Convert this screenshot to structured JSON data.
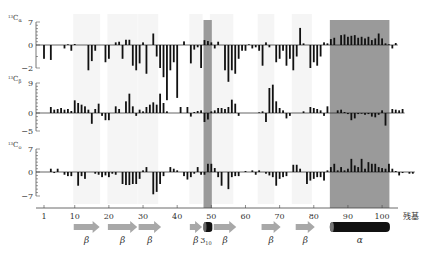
{
  "chart_data": {
    "type": "bar",
    "title": "",
    "xlabel": "残基",
    "x_ticks": [
      1,
      10,
      20,
      30,
      40,
      50,
      60,
      70,
      80,
      90,
      100
    ],
    "x_range": [
      1,
      104
    ],
    "highlight_regions": [
      {
        "start": 48,
        "end": 50,
        "color": "#9a9a9a"
      },
      {
        "start": 85,
        "end": 102,
        "color": "#9a9a9a"
      }
    ],
    "light_bands": [
      {
        "start": 10,
        "end": 17
      },
      {
        "start": 20,
        "end": 28
      },
      {
        "start": 29,
        "end": 34
      },
      {
        "start": 44,
        "end": 47
      },
      {
        "start": 50,
        "end": 56
      },
      {
        "start": 64,
        "end": 68
      },
      {
        "start": 74,
        "end": 79
      }
    ],
    "panels": [
      {
        "name": "13C-alpha",
        "ylabel_sup": "13",
        "ylabel_main": "C",
        "ylabel_sub": "α",
        "yticks": [
          7,
          0,
          -2
        ],
        "ylim": [
          -2,
          7
        ],
        "values": [
          -1.2,
          0,
          -1.3,
          0,
          0,
          0,
          -0.3,
          0.2,
          -0.5,
          0.3,
          0,
          0,
          0,
          -2.2,
          -1.4,
          -0.5,
          0,
          0,
          -1.5,
          -1.2,
          0,
          0.8,
          1.0,
          -1.2,
          1.6,
          1.6,
          -1.8,
          -2.2,
          -1.6,
          0.8,
          -2.5,
          0,
          3.5,
          -1.0,
          -2.0,
          -2.8,
          -4.8,
          -2.2,
          -1.5,
          -4.6,
          0,
          1.1,
          0,
          -1.6,
          -0.4,
          -0.2,
          -2.0,
          1.5,
          1.2,
          0.8,
          -0.3,
          1.0,
          0,
          -2.2,
          -3.2,
          -2.2,
          -2.5,
          -1.2,
          -0.5,
          -0.5,
          0.2,
          -0.3,
          -0.2,
          -0.5,
          -1.8,
          0.8,
          -0.2,
          0,
          -1.5,
          -1.2,
          -0.5,
          -1.8,
          -1.2,
          -2.2,
          -1.0,
          5.2,
          0.5,
          0,
          -2.0,
          -1.5,
          -1.8,
          -1.0,
          0.8,
          0.5,
          1.8,
          2.2,
          0,
          3.0,
          3.2,
          2.5,
          2.8,
          3.0,
          2.2,
          2.5,
          2.0,
          2.5,
          1.5,
          2.0,
          3.5,
          2.0,
          0.5,
          0.2,
          -0.3,
          0.6
        ],
        "zero_y": 45,
        "top_y": 22,
        "bottom_y": 68
      },
      {
        "name": "13C-beta",
        "ylabel_sup": "13",
        "ylabel_main": "C",
        "ylabel_sub": "β",
        "yticks": [
          9,
          0,
          -5
        ],
        "ylim": [
          -5,
          9
        ],
        "values": [
          0,
          0,
          1.8,
          1.0,
          1.2,
          1.5,
          1.0,
          1.2,
          0.6,
          3.8,
          3.0,
          2.5,
          2.0,
          1.0,
          -3.0,
          1.2,
          2.8,
          -0.8,
          -2.0,
          -2.0,
          0,
          2.0,
          1.2,
          0,
          3.5,
          5.8,
          2.0,
          -0.8,
          1.0,
          0.5,
          1.8,
          2.5,
          3.2,
          2.5,
          5.8,
          3.0,
          0.5,
          0,
          0,
          0,
          1.8,
          0,
          1.8,
          -1.0,
          0.3,
          0.6,
          0.8,
          -2.5,
          -1.8,
          0.5,
          0.8,
          1.5,
          1.5,
          1.2,
          1.8,
          4.0,
          2.8,
          -0.8,
          0,
          0,
          0,
          0,
          0,
          0.2,
          0.5,
          -2.5,
          7.5,
          8.5,
          3.5,
          1.5,
          0.8,
          -1.5,
          -0.8,
          0,
          0,
          0,
          0.5,
          0,
          1.8,
          1.5,
          1.2,
          0.8,
          -0.8,
          2.0,
          0,
          0,
          0.8,
          1.0,
          0.3,
          -0.3,
          -2.0,
          -1.5,
          -0.3,
          -0.2,
          -0.5,
          -0.3,
          -1.0,
          -1.2,
          -0.5,
          0.8,
          -3.5,
          0,
          1.2,
          1.0,
          0.8,
          1.2
        ],
        "zero_y": 113,
        "top_y": 83,
        "bottom_y": 131
      },
      {
        "name": "13C-o",
        "ylabel_sup": "13",
        "ylabel_main": "C",
        "ylabel_sub": "o",
        "yticks": [
          7,
          0,
          -7
        ],
        "ylim": [
          -7,
          7
        ],
        "values": [
          0,
          0,
          1.0,
          -0.3,
          1.0,
          0,
          -0.8,
          -1.2,
          -1.2,
          0,
          -4.0,
          -1.2,
          -2.0,
          0,
          0,
          -0.5,
          -0.8,
          -1.5,
          -1.0,
          -1.5,
          -0.5,
          -0.8,
          0,
          -3.5,
          -3.8,
          -3.8,
          -3.5,
          -3.5,
          -2.0,
          0.5,
          1.5,
          0,
          -6.5,
          -5.8,
          -3.5,
          -1.2,
          0,
          1.5,
          1.0,
          0.5,
          0,
          -1.2,
          -2.2,
          -1.5,
          -0.5,
          1.5,
          -0.8,
          -0.8,
          2.5,
          2.5,
          1.2,
          -1.5,
          -4.0,
          0,
          -5.0,
          -1.5,
          -1.2,
          -1.2,
          0,
          0.3,
          0,
          0.5,
          -0.8,
          0.5,
          0,
          -0.5,
          -1.0,
          -1.5,
          -4.0,
          -2.0,
          -1.5,
          -1.2,
          0,
          2.2,
          2.2,
          1.0,
          0,
          -3.5,
          -2.5,
          -2.0,
          -1.5,
          -1.5,
          -2.5,
          0.5,
          1.5,
          2.5,
          0.5,
          1.5,
          0.5,
          1.0,
          4.0,
          2.0,
          1.5,
          4.0,
          1.0,
          3.0,
          2.5,
          2.5,
          1.5,
          1.2,
          1.0,
          2.5,
          1.0,
          0.3,
          -1.0,
          -0.3,
          0,
          -0.5,
          -0.5
        ],
        "zero_y": 172,
        "top_y": 149,
        "bottom_y": 196
      }
    ],
    "secondary_structure": [
      {
        "type": "strand",
        "label": "β",
        "start": 10,
        "end": 17
      },
      {
        "type": "strand",
        "label": "β",
        "start": 20,
        "end": 28
      },
      {
        "type": "strand",
        "label": "β",
        "start": 29,
        "end": 35
      },
      {
        "type": "strand",
        "label": "β",
        "start": 44,
        "end": 47
      },
      {
        "type": "helix310",
        "label": "3",
        "label_sub": "10",
        "start": 48,
        "end": 50
      },
      {
        "type": "strand",
        "label": "β",
        "start": 51,
        "end": 57
      },
      {
        "type": "strand",
        "label": "β",
        "start": 65,
        "end": 70
      },
      {
        "type": "strand",
        "label": "β",
        "start": 75,
        "end": 80
      },
      {
        "type": "helix",
        "label": "α",
        "start": 85,
        "end": 102
      }
    ]
  },
  "axis": {
    "xlabel": "残基",
    "ticks": [
      "1",
      "10",
      "20",
      "30",
      "40",
      "50",
      "60",
      "70",
      "80",
      "90",
      "100"
    ]
  }
}
